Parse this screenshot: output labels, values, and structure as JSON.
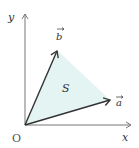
{
  "diagram": {
    "title": "",
    "origin_label": "O",
    "x_axis_label": "x",
    "y_axis_label": "y",
    "vector_a_label": "a",
    "vector_b_label": "b",
    "area_label": "S",
    "colors": {
      "area_fill": "#e3f4f3",
      "vector_stroke": "#333333",
      "axis_stroke": "#777777"
    },
    "points": {
      "origin": [
        25,
        125
      ],
      "a_tip": [
        110,
        100
      ],
      "b_tip": [
        57,
        50
      ]
    }
  }
}
